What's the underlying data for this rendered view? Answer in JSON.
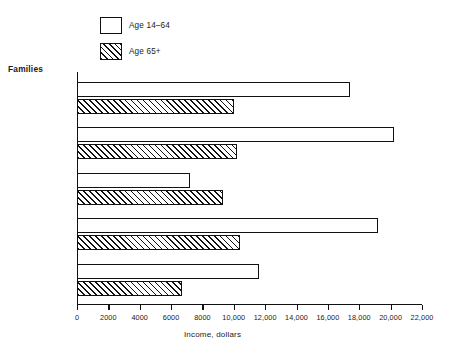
{
  "legend": {
    "items": [
      {
        "label": "Age 14–64",
        "pattern": "solid-white"
      },
      {
        "label": "Age 65+",
        "pattern": "hatched"
      }
    ]
  },
  "group_title": "Families",
  "axis": {
    "x_title": "Income, dollars",
    "x_ticks": [
      "0",
      "2000",
      "4000",
      "6000",
      "8000",
      "10,000",
      "12,000",
      "14,000",
      "16,000",
      "18,000",
      "20,000",
      "22,000"
    ]
  },
  "chart_data": {
    "type": "bar",
    "orientation": "horizontal",
    "title": "Families",
    "xlabel": "Income, dollars",
    "ylabel": "",
    "xlim": [
      0,
      22000
    ],
    "x_ticks": [
      0,
      2000,
      4000,
      6000,
      8000,
      10000,
      12000,
      14000,
      16000,
      18000,
      20000,
      22000
    ],
    "x_tick_labels": [
      "0",
      "2000",
      "4000",
      "6000",
      "8000",
      "10,000",
      "12,000",
      "14,000",
      "16,000",
      "18,000",
      "20,000",
      "22,000"
    ],
    "grid": false,
    "legend_position": "top-left",
    "categories": [
      "Total",
      "Male head",
      "Female head",
      "White",
      "Black"
    ],
    "series": [
      {
        "name": "Age 14–64",
        "pattern": "solid-white",
        "values": [
          17400,
          20200,
          7200,
          19200,
          11600
        ]
      },
      {
        "name": "Age 65+",
        "pattern": "hatched",
        "values": [
          10000,
          10200,
          9300,
          10400,
          6700
        ]
      }
    ]
  }
}
